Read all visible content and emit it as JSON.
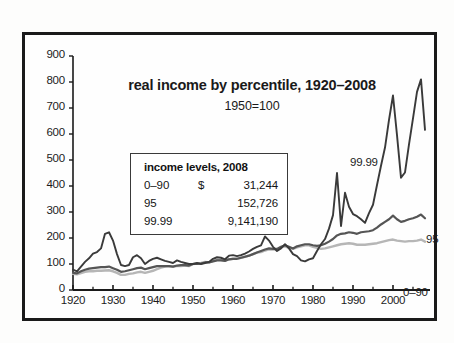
{
  "chart_data": {
    "type": "line",
    "title": "real income by percentile, 1920–2008",
    "subtitle": "1950=100",
    "xlabel": "",
    "ylabel": "",
    "xlim": [
      1920,
      2008
    ],
    "ylim": [
      0,
      900
    ],
    "grid": false,
    "legend_position": "inside-plot-labels",
    "yticks": [
      0,
      100,
      200,
      300,
      400,
      500,
      600,
      700,
      800,
      900
    ],
    "ytick_labels": [
      "0",
      "100",
      "200",
      "300",
      "400",
      "500",
      "600",
      "700",
      "800",
      "900"
    ],
    "xticks": [
      1920,
      1930,
      1940,
      1950,
      1960,
      1970,
      1980,
      1990,
      2000
    ],
    "xtick_labels": [
      "1920",
      "1930",
      "1940",
      "1950",
      "1960",
      "1970",
      "1980",
      "1990",
      "2000"
    ],
    "x_minor_tick_interval": 5,
    "series": [
      {
        "name": "0–90",
        "label": "0–90",
        "color": "#b6b6b6",
        "x": [
          1920,
          1921,
          1922,
          1923,
          1924,
          1925,
          1926,
          1927,
          1928,
          1929,
          1930,
          1931,
          1932,
          1933,
          1934,
          1935,
          1936,
          1937,
          1938,
          1939,
          1940,
          1941,
          1942,
          1943,
          1944,
          1945,
          1946,
          1947,
          1948,
          1949,
          1950,
          1951,
          1952,
          1953,
          1954,
          1955,
          1956,
          1957,
          1958,
          1959,
          1960,
          1961,
          1962,
          1963,
          1964,
          1965,
          1966,
          1967,
          1968,
          1969,
          1970,
          1971,
          1972,
          1973,
          1974,
          1975,
          1976,
          1977,
          1978,
          1979,
          1980,
          1981,
          1982,
          1983,
          1984,
          1985,
          1986,
          1987,
          1988,
          1989,
          1990,
          1991,
          1992,
          1993,
          1994,
          1995,
          1996,
          1997,
          1998,
          1999,
          2000,
          2001,
          2002,
          2003,
          2004,
          2005,
          2006,
          2007,
          2008
        ],
        "values": [
          62,
          60,
          65,
          70,
          72,
          72,
          74,
          74,
          75,
          76,
          72,
          66,
          58,
          58,
          62,
          64,
          68,
          70,
          66,
          70,
          74,
          80,
          86,
          90,
          92,
          90,
          92,
          92,
          94,
          92,
          100,
          102,
          104,
          108,
          106,
          112,
          116,
          116,
          114,
          118,
          120,
          120,
          124,
          128,
          132,
          138,
          144,
          146,
          152,
          156,
          156,
          156,
          164,
          168,
          162,
          158,
          164,
          168,
          172,
          172,
          166,
          162,
          158,
          160,
          164,
          168,
          172,
          176,
          178,
          180,
          178,
          174,
          174,
          174,
          176,
          178,
          180,
          184,
          188,
          192,
          194,
          190,
          188,
          186,
          188,
          188,
          190,
          194,
          186
        ]
      },
      {
        "name": "95",
        "label": "95",
        "color": "#555555",
        "x": [
          1920,
          1921,
          1922,
          1923,
          1924,
          1925,
          1926,
          1927,
          1928,
          1929,
          1930,
          1931,
          1932,
          1933,
          1934,
          1935,
          1936,
          1937,
          1938,
          1939,
          1940,
          1941,
          1942,
          1943,
          1944,
          1945,
          1946,
          1947,
          1948,
          1949,
          1950,
          1951,
          1952,
          1953,
          1954,
          1955,
          1956,
          1957,
          1958,
          1959,
          1960,
          1961,
          1962,
          1963,
          1964,
          1965,
          1966,
          1967,
          1968,
          1969,
          1970,
          1971,
          1972,
          1973,
          1974,
          1975,
          1976,
          1977,
          1978,
          1979,
          1980,
          1981,
          1982,
          1983,
          1984,
          1985,
          1986,
          1987,
          1988,
          1989,
          1990,
          1991,
          1992,
          1993,
          1994,
          1995,
          1996,
          1997,
          1998,
          1999,
          2000,
          2001,
          2002,
          2003,
          2004,
          2005,
          2006,
          2007,
          2008
        ],
        "values": [
          66,
          64,
          72,
          78,
          82,
          84,
          86,
          88,
          88,
          90,
          84,
          78,
          70,
          72,
          76,
          80,
          84,
          86,
          80,
          84,
          88,
          92,
          92,
          92,
          92,
          90,
          94,
          96,
          96,
          94,
          100,
          100,
          102,
          106,
          106,
          110,
          114,
          114,
          112,
          118,
          120,
          120,
          124,
          128,
          132,
          138,
          144,
          150,
          156,
          160,
          158,
          158,
          166,
          172,
          166,
          160,
          168,
          172,
          176,
          176,
          172,
          170,
          172,
          178,
          186,
          196,
          210,
          216,
          218,
          222,
          220,
          216,
          222,
          224,
          226,
          230,
          240,
          252,
          262,
          272,
          286,
          272,
          262,
          266,
          272,
          276,
          282,
          290,
          276
        ]
      },
      {
        "name": "99.99",
        "label": "99.99",
        "color": "#3a3a3a",
        "x": [
          1920,
          1921,
          1922,
          1923,
          1924,
          1925,
          1926,
          1927,
          1928,
          1929,
          1930,
          1931,
          1932,
          1933,
          1934,
          1935,
          1936,
          1937,
          1938,
          1939,
          1940,
          1941,
          1942,
          1943,
          1944,
          1945,
          1946,
          1947,
          1948,
          1949,
          1950,
          1951,
          1952,
          1953,
          1954,
          1955,
          1956,
          1957,
          1958,
          1959,
          1960,
          1961,
          1962,
          1963,
          1964,
          1965,
          1966,
          1967,
          1968,
          1969,
          1970,
          1971,
          1972,
          1973,
          1974,
          1975,
          1976,
          1977,
          1978,
          1979,
          1980,
          1981,
          1982,
          1983,
          1984,
          1985,
          1986,
          1987,
          1988,
          1989,
          1990,
          1991,
          1992,
          1993,
          1994,
          1995,
          1996,
          1997,
          1998,
          1999,
          2000,
          2001,
          2002,
          2003,
          2004,
          2005,
          2006,
          2007,
          2008
        ],
        "values": [
          78,
          72,
          90,
          108,
          122,
          140,
          146,
          160,
          216,
          222,
          190,
          138,
          96,
          92,
          96,
          126,
          134,
          122,
          100,
          112,
          120,
          124,
          118,
          112,
          108,
          104,
          114,
          108,
          104,
          100,
          100,
          104,
          100,
          104,
          108,
          120,
          126,
          124,
          118,
          132,
          134,
          130,
          134,
          140,
          148,
          158,
          166,
          172,
          206,
          190,
          166,
          150,
          160,
          176,
          160,
          138,
          130,
          114,
          110,
          118,
          122,
          150,
          176,
          196,
          236,
          288,
          450,
          246,
          374,
          320,
          292,
          284,
          272,
          258,
          296,
          328,
          404,
          478,
          548,
          654,
          748,
          596,
          432,
          452,
          560,
          660,
          762,
          810,
          616
        ]
      }
    ],
    "series_labels_on_plot": [
      {
        "text": "99.99",
        "at": {
          "x": 1993,
          "y": 645
        }
      },
      {
        "text": "95",
        "at": {
          "x": 2007,
          "y": 340
        }
      },
      {
        "text": "0–90",
        "at": {
          "x": 2001,
          "y": 145
        }
      }
    ],
    "annotations": {
      "box": {
        "title": "income levels, 2008",
        "rows": [
          {
            "label": "0–90",
            "currency": "$",
            "value": "31,244"
          },
          {
            "label": "95",
            "currency": "",
            "value": "152,726"
          },
          {
            "label": "99.99",
            "currency": "",
            "value": "9,141,190"
          }
        ]
      }
    },
    "colors": {
      "frame": "#1a1a1a",
      "axis": "#1a1a1a",
      "background": "#fefefe",
      "series_0_90": "#b6b6b6",
      "series_95": "#555555",
      "series_99_99": "#3a3a3a"
    }
  }
}
